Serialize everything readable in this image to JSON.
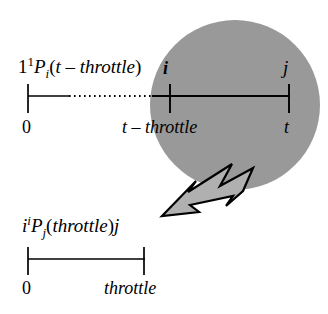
{
  "figure": {
    "name": "probability-timeline-diagram",
    "background_color": "#ffffff",
    "ink_color": "#000000",
    "circle_fill": "#999999",
    "arrow_fill": "#b0b0b0",
    "arrow_outline": "#000000"
  },
  "top_timeline": {
    "expression": {
      "leading": "1",
      "superscript": "1",
      "symbol": "P",
      "subscript": "i",
      "open_paren": "(",
      "argument": "t – throttle",
      "close_paren": ")"
    },
    "node_start_label": "i",
    "node_end_label": "j",
    "ticks": [
      {
        "label": "0"
      },
      {
        "label": "t – throttle"
      },
      {
        "label": "t"
      }
    ]
  },
  "bottom_timeline": {
    "expression": {
      "leading": "i",
      "superscript": "i",
      "symbol": "P",
      "subscript": "j",
      "open_paren": "(",
      "argument": "throttle",
      "close_paren": ")"
    },
    "node_end_label": "j",
    "ticks": [
      {
        "label": "0"
      },
      {
        "label": "throttle"
      }
    ]
  }
}
